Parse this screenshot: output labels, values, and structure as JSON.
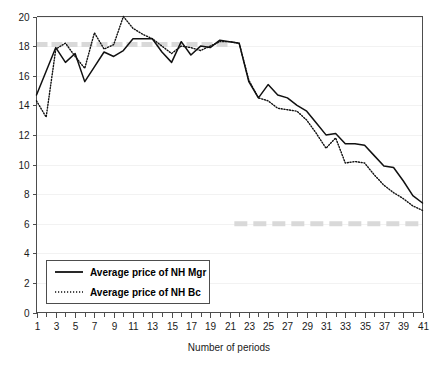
{
  "chart_data": {
    "type": "line",
    "title": "",
    "subtitle": "",
    "xlabel": "Number of periods",
    "ylabel": "",
    "xlim": [
      1,
      41
    ],
    "ylim": [
      0,
      20
    ],
    "grid": true,
    "legend_position": "lower-left-inside",
    "x": [
      1,
      2,
      3,
      4,
      5,
      6,
      7,
      8,
      9,
      10,
      11,
      12,
      13,
      14,
      15,
      16,
      17,
      18,
      19,
      20,
      21,
      22,
      23,
      24,
      25,
      26,
      27,
      28,
      29,
      30,
      31,
      32,
      33,
      34,
      35,
      36,
      37,
      38,
      39,
      40,
      41
    ],
    "x_tick_labels": [
      "1",
      "3",
      "5",
      "7",
      "9",
      "11",
      "13",
      "15",
      "17",
      "19",
      "21",
      "23",
      "25",
      "27",
      "29",
      "31",
      "33",
      "35",
      "37",
      "39",
      "41"
    ],
    "y_tick_labels": [
      "0",
      "2",
      "4",
      "6",
      "8",
      "10",
      "12",
      "14",
      "16",
      "18",
      "20"
    ],
    "y_ticks": [
      0,
      2,
      4,
      6,
      8,
      10,
      12,
      14,
      16,
      18,
      20
    ],
    "series": [
      {
        "name": "Average price of NH Mgr",
        "style": "solid",
        "color": "#111111",
        "values": [
          14.7,
          16.3,
          17.9,
          16.9,
          17.5,
          15.6,
          16.6,
          17.6,
          17.3,
          17.7,
          18.5,
          18.5,
          18.5,
          17.6,
          16.9,
          18.3,
          17.4,
          18.0,
          17.9,
          18.4,
          18.3,
          18.2,
          15.6,
          14.5,
          15.4,
          14.7,
          14.5,
          14.0,
          13.6,
          12.8,
          12.0,
          12.1,
          11.4,
          11.4,
          11.3,
          10.6,
          9.9,
          9.8,
          8.9,
          7.9,
          7.4
        ]
      },
      {
        "name": "Average price of NH Bc",
        "style": "dotted",
        "color": "#111111",
        "values": [
          14.3,
          13.2,
          17.8,
          18.2,
          17.3,
          16.5,
          18.9,
          17.8,
          18.1,
          20.0,
          19.2,
          18.8,
          18.5,
          18.0,
          17.5,
          18.0,
          17.9,
          17.7,
          18.0,
          18.3,
          18.3,
          18.2,
          15.7,
          14.5,
          14.3,
          13.8,
          13.7,
          13.6,
          13.0,
          12.1,
          11.1,
          11.8,
          10.1,
          10.2,
          10.1,
          9.3,
          8.6,
          8.1,
          7.7,
          7.2,
          6.9
        ]
      }
    ],
    "reference_bands": [
      {
        "name": "upper-reference-band",
        "value": 18.1,
        "x_start": 1,
        "x_end": 21,
        "color": "#d9d9d9"
      },
      {
        "name": "lower-reference-band",
        "value": 6.0,
        "x_start": 21.5,
        "x_end": 41,
        "color": "#d9d9d9"
      }
    ],
    "legend": [
      {
        "label": "Average price of NH Mgr",
        "style": "solid"
      },
      {
        "label": "Average price of NH Bc",
        "style": "dotted"
      }
    ]
  }
}
